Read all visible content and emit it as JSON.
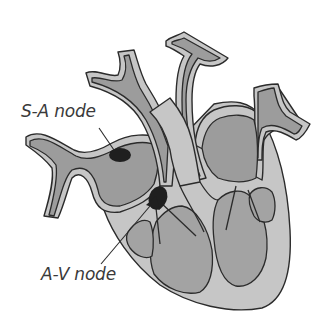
{
  "diagram": {
    "labels": {
      "sa_node": "S-A node",
      "av_node": "A-V node"
    },
    "colors": {
      "background": "#ffffff",
      "outline": "#2b2b2b",
      "vessel_wall": "#c6c6c6",
      "vessel_lumen": "#9c9c9c",
      "chamber": "#a3a3a3",
      "node": "#1f1f1f",
      "label_text": "#3a3a3a"
    },
    "parts": [
      {
        "name": "superior-vena-cava",
        "role": "vessel"
      },
      {
        "name": "aorta",
        "role": "vessel"
      },
      {
        "name": "pulmonary-artery",
        "role": "vessel"
      },
      {
        "name": "pulmonary-vein",
        "role": "vessel"
      },
      {
        "name": "right-atrium",
        "role": "chamber"
      },
      {
        "name": "left-atrium",
        "role": "chamber"
      },
      {
        "name": "right-ventricle",
        "role": "chamber"
      },
      {
        "name": "left-ventricle",
        "role": "chamber"
      },
      {
        "name": "sa-node",
        "role": "node"
      },
      {
        "name": "av-node",
        "role": "node"
      }
    ]
  }
}
